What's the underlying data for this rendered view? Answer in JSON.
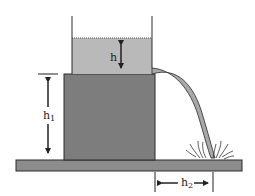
{
  "diagram": {
    "labels": {
      "h": "h",
      "h1_main": "h",
      "h1_sub": "1",
      "h2_main": "h",
      "h2_sub": "2"
    },
    "colors": {
      "background": "#ffffff",
      "water": "#b9b9b9",
      "block": "#7d7d7d",
      "ground": "#8c8c8c",
      "stroke": "#2a2a2a",
      "stream": "#a8a8a8"
    }
  }
}
